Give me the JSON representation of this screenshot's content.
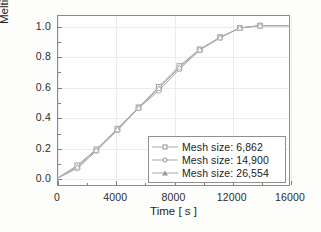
{
  "chart_data": {
    "type": "line",
    "title": "",
    "xlabel": "Time [ s ]",
    "ylabel": "Melting fraction",
    "xlim": [
      0,
      16000
    ],
    "ylim": [
      -0.05,
      1.07
    ],
    "xticks": [
      0,
      4000,
      8000,
      12000,
      16000
    ],
    "xtick_labels": [
      "0",
      "4000",
      "8000",
      "12000",
      "16000"
    ],
    "yticks": [
      0.0,
      0.2,
      0.4,
      0.6,
      0.8,
      1.0
    ],
    "ytick_labels": [
      "0.0",
      "0.2",
      "0.4",
      "0.6",
      "0.8",
      "1.0"
    ],
    "xminor_ticks": [
      2000,
      6000,
      10000,
      14000
    ],
    "yminor_ticks": [
      0.1,
      0.3,
      0.5,
      0.7,
      0.9
    ],
    "grid": true,
    "legend_position": "lower right",
    "series": [
      {
        "name": "Mesh size: 6,862",
        "marker": "square",
        "color": "#9a9a9a",
        "x": [
          0,
          1400,
          2700,
          4150,
          5600,
          7000,
          8400,
          9800,
          11200,
          12550,
          13950,
          16000
        ],
        "y": [
          0.0,
          0.085,
          0.19,
          0.325,
          0.465,
          0.6,
          0.735,
          0.845,
          0.925,
          0.985,
          1.0,
          1.0
        ]
      },
      {
        "name": "Mesh size: 14,900",
        "marker": "circle",
        "color": "#a5a5a5",
        "x": [
          0,
          1400,
          2700,
          4150,
          5600,
          7000,
          8400,
          9800,
          11200,
          12550,
          13950,
          16000
        ],
        "y": [
          0.0,
          0.065,
          0.18,
          0.315,
          0.46,
          0.575,
          0.715,
          0.84,
          0.92,
          0.985,
          1.0,
          1.0
        ]
      },
      {
        "name": "Mesh size: 26,554",
        "marker": "triangle",
        "color": "#adadad",
        "x": [
          0,
          1400,
          2700,
          4150,
          5600,
          7000,
          8400,
          9800,
          11200,
          12550,
          13950,
          16000
        ],
        "y": [
          0.0,
          0.075,
          0.185,
          0.32,
          0.462,
          0.59,
          0.725,
          0.843,
          0.922,
          0.985,
          1.0,
          1.0
        ]
      }
    ]
  },
  "legend": {
    "entries": [
      {
        "label": "Mesh size: 6,862"
      },
      {
        "label": "Mesh size: 14,900"
      },
      {
        "label": "Mesh size: 26,554"
      }
    ]
  },
  "colors": {
    "frame": "#8a8a8a",
    "grid": "#ececec",
    "text": "#1f1f1f",
    "background": "#fdfdfb"
  }
}
